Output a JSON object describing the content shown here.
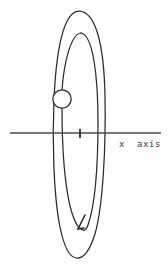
{
  "figure": {
    "title": "",
    "type": "orbit-diagram",
    "background_color": "#ffffff",
    "stroke_color": "#2b2b2b",
    "axis_color": "#4a4a4a",
    "label_color": "#3d3d3d",
    "axis": {
      "name": "x axis",
      "label": "x  axis",
      "orientation": "horizontal",
      "y_position_px": 133,
      "x_start_px": 10,
      "x_end_px": 161,
      "tick": {
        "name": "origin-tick",
        "x_px": 80,
        "height_px": 9,
        "label": ""
      }
    },
    "orbits": [
      {
        "name": "outer-orbit",
        "shape": "ellipse",
        "center_px": [
          79,
          134
        ],
        "semi_major_px": 124,
        "semi_minor_px": 25,
        "tilt_deg": 4,
        "closed": true
      },
      {
        "name": "inner-orbit",
        "shape": "ellipse",
        "center_px": [
          82,
          122
        ],
        "semi_major_px": 104,
        "semi_minor_px": 17,
        "tilt_deg": 3,
        "closed": false
      }
    ],
    "body": {
      "name": "orbiting-body",
      "shape": "circle",
      "center_px": [
        62,
        99
      ],
      "radius_px": 9,
      "fill": "#ffffff",
      "label": ""
    },
    "direction_arrow": {
      "name": "orbit-direction-arrow",
      "tip_px": [
        79,
        229
      ],
      "direction": "counterclockwise",
      "label": ""
    }
  }
}
